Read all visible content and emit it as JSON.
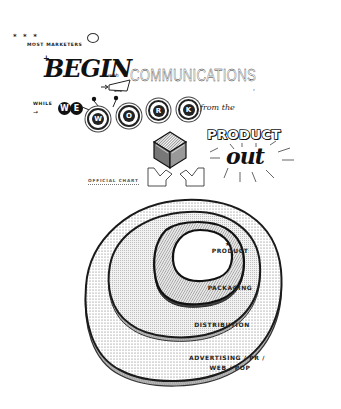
{
  "header": {
    "stars": "* * *",
    "intro": "MOST MARKETERS",
    "plus": "+",
    "begin": "BEGIN",
    "with": "with",
    "communications": "COMMUNICATIONS",
    "comma": ",",
    "while": "WHILE",
    "while_arrow": "→",
    "we_letters": [
      "W",
      "E"
    ],
    "work_letters": [
      "W",
      "O",
      "R",
      "K"
    ],
    "from_the": "from the",
    "product": "PRODUCT",
    "out": "out"
  },
  "caption": {
    "official_chart": "OFFICIAL CHART"
  },
  "diagram": {
    "star_mark": "★",
    "layers": [
      {
        "label": "PRODUCT",
        "fill": "#ffffff"
      },
      {
        "label": "PACKAGING",
        "fill": "#cfcfcf"
      },
      {
        "label": "DISTRIBUTION",
        "fill": "#e2e2e2"
      },
      {
        "label_line1": "ADVERTISING / PR /",
        "label_line2": "WEB / POP",
        "fill": "#ececec"
      }
    ]
  },
  "colors": {
    "ink": "#1a1a1a",
    "paper": "#ffffff"
  }
}
